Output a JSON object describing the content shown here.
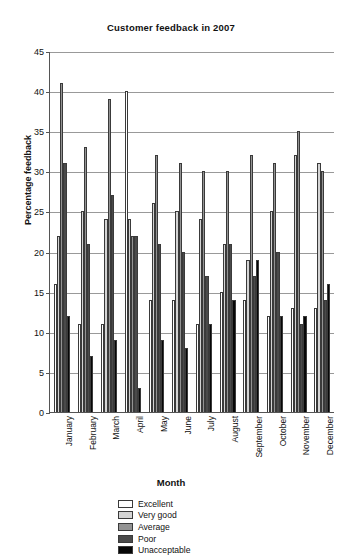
{
  "chart_data": {
    "type": "bar",
    "title": "Customer feedback in 2007",
    "xlabel": "Month",
    "ylabel": "Percentage feedback",
    "ylim": [
      0,
      45
    ],
    "ytick_step": 5,
    "yticks": [
      0,
      5,
      10,
      15,
      20,
      25,
      30,
      35,
      40,
      45
    ],
    "grid": true,
    "legend_position": "bottom-center",
    "categories": [
      "January",
      "February",
      "March",
      "April",
      "May",
      "June",
      "July",
      "August",
      "September",
      "October",
      "November",
      "December"
    ],
    "series": [
      {
        "name": "Excellent",
        "color": "#ffffff",
        "values": [
          16,
          11,
          11,
          40,
          14,
          14,
          11,
          15,
          14,
          12,
          13,
          13
        ]
      },
      {
        "name": "Very good",
        "color": "#d4d4d4",
        "values": [
          22,
          25,
          24,
          24,
          26,
          25,
          24,
          21,
          19,
          25,
          32,
          31
        ]
      },
      {
        "name": "Average",
        "color": "#939393",
        "values": [
          41,
          33,
          39,
          22,
          32,
          31,
          30,
          30,
          32,
          31,
          35,
          30
        ]
      },
      {
        "name": "Poor",
        "color": "#4a4a4a",
        "values": [
          31,
          21,
          27,
          22,
          21,
          20,
          17,
          21,
          17,
          20,
          11,
          14
        ]
      },
      {
        "name": "Unacceptable",
        "color": "#070707",
        "values": [
          12,
          7,
          9,
          3,
          9,
          8,
          11,
          14,
          19,
          12,
          12,
          16
        ]
      }
    ]
  }
}
